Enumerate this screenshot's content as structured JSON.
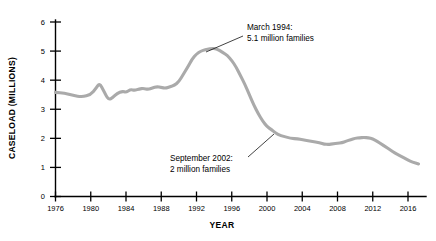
{
  "chart_data": {
    "type": "line",
    "title": "",
    "xlabel": "YEAR",
    "ylabel": "CASELOAD (MILLIONS)",
    "xlim": [
      1976,
      2017.5
    ],
    "ylim": [
      0,
      6
    ],
    "xticks": [
      1976,
      1980,
      1984,
      1988,
      1992,
      1996,
      2000,
      2004,
      2008,
      2012,
      2016
    ],
    "xtick_labels": [
      "1976",
      "1980",
      "1984",
      "1988",
      "1992",
      "1996",
      "2000",
      "2004",
      "2008",
      "2012",
      "2016"
    ],
    "yticks": [
      0,
      1,
      2,
      3,
      4,
      5,
      6
    ],
    "ytick_labels": [
      "0",
      "1",
      "2",
      "3",
      "4",
      "5",
      "6"
    ],
    "grid": false,
    "legend": false,
    "line_color": "#aaaaaa",
    "series": [
      {
        "name": "Caseload",
        "x": [
          1976,
          1977,
          1978,
          1979,
          1980,
          1980.6,
          1981,
          1981.5,
          1982,
          1982.5,
          1983,
          1983.6,
          1984,
          1984.5,
          1985,
          1985.5,
          1986,
          1986.5,
          1987,
          1987.5,
          1988,
          1988.5,
          1989,
          1989.5,
          1990,
          1990.5,
          1991,
          1991.5,
          1992,
          1992.5,
          1993,
          1993.5,
          1994.2,
          1995,
          1995.5,
          1996,
          1996.5,
          1997,
          1997.5,
          1998,
          1998.5,
          1999,
          1999.5,
          2000,
          2000.5,
          2001,
          2001.5,
          2002.7,
          2003.5,
          2004,
          2005,
          2006,
          2006.5,
          2007,
          2007.5,
          2008,
          2008.5,
          2009,
          2009.5,
          2010,
          2010.5,
          2011,
          2011.5,
          2012,
          2012.5,
          2013,
          2013.5,
          2014,
          2014.5,
          2015,
          2016,
          2016.5,
          2017.2
        ],
        "y": [
          3.58,
          3.55,
          3.48,
          3.42,
          3.5,
          3.72,
          3.9,
          3.62,
          3.32,
          3.4,
          3.55,
          3.62,
          3.58,
          3.68,
          3.65,
          3.7,
          3.72,
          3.68,
          3.73,
          3.78,
          3.75,
          3.72,
          3.78,
          3.82,
          3.95,
          4.2,
          4.45,
          4.72,
          4.9,
          5.0,
          5.05,
          5.08,
          5.1,
          4.95,
          4.85,
          4.68,
          4.45,
          4.15,
          3.85,
          3.5,
          3.15,
          2.85,
          2.6,
          2.4,
          2.3,
          2.18,
          2.1,
          2.0,
          1.98,
          1.95,
          1.9,
          1.85,
          1.8,
          1.79,
          1.81,
          1.83,
          1.85,
          1.9,
          1.96,
          2.0,
          2.02,
          2.03,
          2.02,
          1.98,
          1.9,
          1.8,
          1.7,
          1.6,
          1.5,
          1.42,
          1.25,
          1.18,
          1.12
        ]
      }
    ],
    "annotations": [
      {
        "id": "peak",
        "lines": [
          "March 1994:",
          "5.1 million families"
        ],
        "text_x": 247,
        "text_y": 30,
        "leader_from_x": 243,
        "leader_from_y": 36,
        "leader_to_x": 206,
        "leader_to_y": 52,
        "point_year": 1994.2,
        "point_value": 5.1
      },
      {
        "id": "trough",
        "lines": [
          "September 2002:",
          "2 million families"
        ],
        "text_x": 170,
        "text_y": 161,
        "leader_from_x": 248,
        "leader_from_y": 157,
        "leader_to_x": 274,
        "leader_to_y": 134,
        "point_year": 2002.7,
        "point_value": 2.0
      }
    ]
  }
}
